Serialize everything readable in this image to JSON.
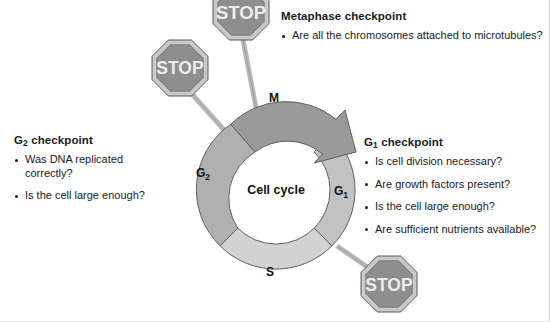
{
  "figure": {
    "center_label": "Cell cycle",
    "phases": [
      {
        "id": "M",
        "label": "M"
      },
      {
        "id": "G1",
        "label": "G",
        "sub": "1"
      },
      {
        "id": "S",
        "label": "S"
      },
      {
        "id": "G2",
        "label": "G",
        "sub": "2"
      }
    ],
    "colors": {
      "phase_m": "#9a9a9a",
      "phase_g1": "#c2c2c2",
      "phase_s": "#d2d2d2",
      "phase_g2": "#b0b0b0",
      "stop_sign_face": "#8e8e8e",
      "stop_sign_rim": "#c9c9c9",
      "stop_text": "#ececec",
      "post": "#b8b8b8",
      "outline": "#4d4d4d",
      "text": "#1a1a1a"
    }
  },
  "stop_signs": [
    {
      "id": "stop-g2",
      "label": "STOP"
    },
    {
      "id": "stop-metaphase",
      "label": "STOP"
    },
    {
      "id": "stop-g1",
      "label": "STOP"
    }
  ],
  "checkpoints": {
    "g2": {
      "title_main": "G",
      "title_sub": "2",
      "title_rest": " checkpoint",
      "items": [
        "Was DNA replicated\ncorrectly?",
        "Is the cell large enough?"
      ]
    },
    "metaphase": {
      "title": "Metaphase checkpoint",
      "items": [
        "Are all the chromosomes attached to microtubules?"
      ]
    },
    "g1": {
      "title_main": "G",
      "title_sub": "1",
      "title_rest": " checkpoint",
      "items": [
        "Is cell division necessary?",
        "Are growth factors present?",
        "Is the cell large enough?",
        "Are sufficient nutrients available?"
      ]
    }
  }
}
